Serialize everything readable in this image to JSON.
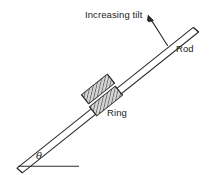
{
  "figure": {
    "type": "physics-diagram",
    "background_color": "#ffffff",
    "line_color": "#2b2b2b",
    "hatch_color": "#4a4a4a",
    "ring_fill_color": "#cfcfcf",
    "labels": {
      "increasing_tilt": "Increasing tilt",
      "rod": "Rod",
      "ring": "Ring",
      "angle": "θ"
    },
    "elements": {
      "rod": {
        "name": "rod",
        "description": "long straight bar drawn as two parallel lines with angled cut ends",
        "start_x": 18,
        "start_y": 166,
        "end_x": 196,
        "end_y": 30,
        "thickness": 5
      },
      "ring": {
        "name": "ring",
        "description": "hatched cylindrical sleeve encircling the rod",
        "center_x": 101,
        "center_y": 95,
        "length": 34,
        "width": 13
      },
      "baseline": {
        "name": "horizontal-reference-line",
        "start_x": 18,
        "start_y": 166,
        "end_x": 79,
        "end_y": 166
      },
      "tilt_arrow": {
        "name": "rotation-direction-arrow",
        "description": "curved arrow from rod sweeping up and to the left",
        "tail_x": 166,
        "tail_y": 44,
        "head_x": 148,
        "head_y": 16
      }
    }
  }
}
